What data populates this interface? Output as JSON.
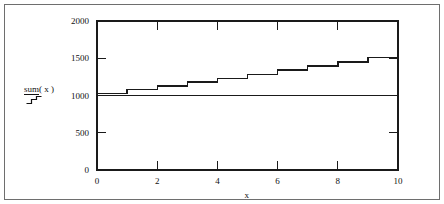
{
  "chart_data": {
    "type": "line",
    "subtype": "step",
    "title": "",
    "xlabel": "x",
    "ylabel": "sum ( x )",
    "xlim": [
      0,
      10
    ],
    "ylim": [
      0,
      2000
    ],
    "xticks": [
      0,
      2,
      4,
      6,
      8,
      10
    ],
    "xtick_labels": [
      "0",
      "2",
      "4",
      "6",
      "8",
      "10"
    ],
    "yticks": [
      0,
      500,
      1000,
      1500,
      2000
    ],
    "ytick_labels": [
      "0",
      "500",
      "1000",
      "1500",
      "2000"
    ],
    "y_major_gridlines": [
      1000,
      2000
    ],
    "y_minor_ticks": [
      500,
      1500
    ],
    "grid": false,
    "legend": false,
    "line_color": "#1a1a1a",
    "series": [
      {
        "name": "sum ( x )",
        "step_mode": "post",
        "x": [
          0,
          1,
          2,
          3,
          4,
          5,
          6,
          7,
          8,
          9,
          10
        ],
        "values": [
          1030,
          1080,
          1130,
          1180,
          1230,
          1285,
          1340,
          1395,
          1450,
          1510,
          1560
        ]
      }
    ]
  },
  "axes": {
    "y_title_primary": "sum",
    "y_title_arg": "( x )",
    "x_title": "x"
  }
}
